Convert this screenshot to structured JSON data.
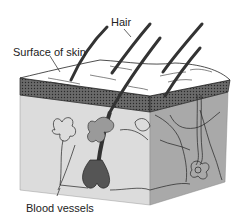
{
  "diagram": {
    "labels": {
      "hair": "Hair",
      "surface": "Surface of skin",
      "blood_vessels": "Blood vessels"
    },
    "colors": {
      "background": "#ffffff",
      "surface": "#ffffff",
      "epidermis": "#5a5a5a",
      "dermis_front": "#d9d9d9",
      "dermis_side": "#a8a8a8",
      "hair": "#333333",
      "outline": "#222222"
    }
  }
}
